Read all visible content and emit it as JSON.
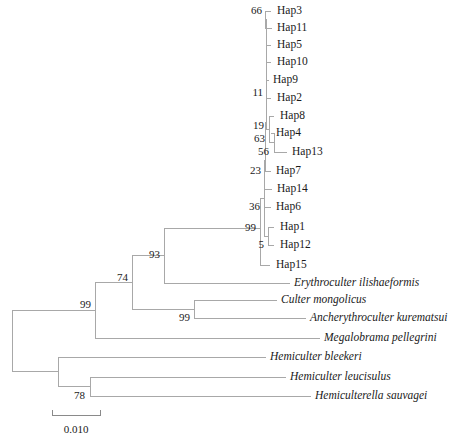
{
  "figure": {
    "kind": "phylogenetic-tree",
    "width": 451,
    "height": 444,
    "background_color": "#ffffff",
    "branch_color": "#a8a8a8",
    "text_color": "#1a1a1a"
  },
  "scale_bar": {
    "label": "0.010",
    "x_start": 52,
    "x_end": 100,
    "y": 415,
    "tick_height": 5,
    "label_x": 76,
    "label_y": 430
  },
  "chart_data": {
    "type": "tree",
    "title": "",
    "xlabel": "",
    "ylabel": "",
    "scale_bar_value": 0.01,
    "tips": [
      {
        "name": "Hap3",
        "label": "Hap3",
        "italic": false,
        "x_tip": 271,
        "y": 11,
        "label_x": 277
      },
      {
        "name": "Hap11",
        "label": "Hap11",
        "italic": false,
        "x_tip": 272,
        "y": 28,
        "label_x": 277
      },
      {
        "name": "Hap5",
        "label": "Hap5",
        "italic": false,
        "x_tip": 271,
        "y": 45,
        "label_x": 277
      },
      {
        "name": "Hap10",
        "label": "Hap10",
        "italic": false,
        "x_tip": 271,
        "y": 62,
        "label_x": 277
      },
      {
        "name": "Hap9",
        "label": "Hap9",
        "italic": false,
        "x_tip": 269,
        "y": 80,
        "label_x": 273
      },
      {
        "name": "Hap2",
        "label": "Hap2",
        "italic": false,
        "x_tip": 271,
        "y": 98,
        "label_x": 277
      },
      {
        "name": "Hap8",
        "label": "Hap8",
        "italic": false,
        "x_tip": 274,
        "y": 116,
        "label_x": 280
      },
      {
        "name": "Hap4",
        "label": "Hap4",
        "italic": false,
        "x_tip": 271,
        "y": 133,
        "label_x": 276
      },
      {
        "name": "Hap13",
        "label": "Hap13",
        "italic": false,
        "x_tip": 287,
        "y": 152,
        "label_x": 292
      },
      {
        "name": "Hap7",
        "label": "Hap7",
        "italic": false,
        "x_tip": 271,
        "y": 171,
        "label_x": 276
      },
      {
        "name": "Hap14",
        "label": "Hap14",
        "italic": false,
        "x_tip": 272,
        "y": 189,
        "label_x": 277
      },
      {
        "name": "Hap6",
        "label": "Hap6",
        "italic": false,
        "x_tip": 271,
        "y": 207,
        "label_x": 276
      },
      {
        "name": "Hap1",
        "label": "Hap1",
        "italic": false,
        "x_tip": 274,
        "y": 227,
        "label_x": 280
      },
      {
        "name": "Hap12",
        "label": "Hap12",
        "italic": false,
        "x_tip": 274,
        "y": 245,
        "label_x": 280
      },
      {
        "name": "Hap15",
        "label": "Hap15",
        "italic": false,
        "x_tip": 270,
        "y": 265,
        "label_x": 276
      },
      {
        "name": "Erythroculter ilishaeformis",
        "label": "Erythroculter ilishaeformis",
        "italic": true,
        "x_tip": 290,
        "y": 283,
        "label_x": 294
      },
      {
        "name": "Culter mongolicus",
        "label": "Culter mongolicus",
        "italic": true,
        "x_tip": 277,
        "y": 300,
        "label_x": 281
      },
      {
        "name": "Ancherythroculter kurematsui",
        "label": "Ancherythroculter kurematsui",
        "italic": true,
        "x_tip": 306,
        "y": 318,
        "label_x": 310
      },
      {
        "name": "Megalobrama pellegrini",
        "label": "Megalobrama pellegrini",
        "italic": true,
        "x_tip": 320,
        "y": 338,
        "label_x": 324
      },
      {
        "name": "Hemiculter bleekeri",
        "label": "Hemiculter bleekeri",
        "italic": true,
        "x_tip": 266,
        "y": 357,
        "label_x": 270
      },
      {
        "name": "Hemiculter leucisulus",
        "label": "Hemiculter leucisulus",
        "italic": true,
        "x_tip": 286,
        "y": 377,
        "label_x": 290
      },
      {
        "name": "Hemiculterella sauvagei",
        "label": "Hemiculterella sauvagei",
        "italic": true,
        "x_tip": 311,
        "y": 396,
        "label_x": 315
      }
    ],
    "internal_nodes": [
      {
        "name": "node-hap3-hap11",
        "support": "66",
        "x": 265,
        "y": 19,
        "children_y": [
          11,
          28
        ],
        "children_x": [
          271,
          272
        ],
        "label_x": 262,
        "label_y": 11
      },
      {
        "name": "node-hap9-hap2",
        "support": "11",
        "x": 266,
        "y": 89,
        "children_y": [
          80,
          98
        ],
        "children_x": [
          269,
          271
        ],
        "label_x": 263,
        "label_y": 93
      },
      {
        "name": "node-hap4-hap13",
        "support": "56",
        "x": 274,
        "y": 142,
        "children_y": [
          133,
          152
        ],
        "children_x": [
          271,
          287
        ],
        "label_x": 269,
        "label_y": 152
      },
      {
        "name": "node-hap8-clade",
        "support": "63",
        "x": 269,
        "y": 129,
        "children_y": [
          116,
          142
        ],
        "children_x": [
          274,
          274
        ],
        "label_x": 265,
        "label_y": 139
      },
      {
        "name": "node-upper-haps",
        "support": "19",
        "x": 266,
        "y": 122,
        "children_y": [
          19,
          45,
          62,
          89,
          129
        ],
        "children_x": [
          265,
          271,
          271,
          266,
          269
        ],
        "label_x": 264,
        "label_y": 126
      },
      {
        "name": "node-hap7-group",
        "support": "23",
        "x": 265,
        "y": 160,
        "children_y": [
          122,
          171
        ],
        "children_x": [
          266,
          271
        ],
        "label_x": 261,
        "label_y": 171
      },
      {
        "name": "node-hap1-hap12",
        "support": "5",
        "x": 268,
        "y": 236,
        "children_y": [
          227,
          245
        ],
        "children_x": [
          274,
          274
        ],
        "label_x": 264,
        "label_y": 245
      },
      {
        "name": "node-hap6-group",
        "support": "36",
        "x": 264,
        "y": 198,
        "children_y": [
          160,
          189,
          207,
          236
        ],
        "children_x": [
          265,
          272,
          271,
          268
        ],
        "label_x": 260,
        "label_y": 207
      },
      {
        "name": "node-haplotype-clade",
        "support": "99",
        "x": 260,
        "y": 228,
        "children_y": [
          198,
          265
        ],
        "children_x": [
          264,
          270
        ],
        "label_x": 256,
        "label_y": 228
      },
      {
        "name": "node-93",
        "support": "93",
        "x": 164,
        "y": 255,
        "children_y": [
          228,
          283
        ],
        "children_x": [
          260,
          290
        ],
        "label_x": 160,
        "label_y": 255
      },
      {
        "name": "node-culter-ancher",
        "support": "99",
        "x": 194,
        "y": 309,
        "children_y": [
          300,
          318
        ],
        "children_x": [
          277,
          306
        ],
        "label_x": 190,
        "label_y": 318
      },
      {
        "name": "node-74",
        "support": "74",
        "x": 132,
        "y": 282,
        "children_y": [
          255,
          309
        ],
        "children_x": [
          164,
          194
        ],
        "label_x": 128,
        "label_y": 278
      },
      {
        "name": "node-99-upper",
        "support": "99",
        "x": 95,
        "y": 310,
        "children_y": [
          282,
          338
        ],
        "children_x": [
          132,
          320
        ],
        "label_x": 91,
        "label_y": 305
      },
      {
        "name": "node-78",
        "support": "78",
        "x": 90,
        "y": 386,
        "children_y": [
          377,
          396
        ],
        "children_x": [
          286,
          311
        ],
        "label_x": 85,
        "label_y": 396
      },
      {
        "name": "node-hemiculter",
        "support": "",
        "x": 58,
        "y": 371,
        "children_y": [
          357,
          386
        ],
        "children_x": [
          266,
          90
        ],
        "label_x": 54,
        "label_y": 371
      },
      {
        "name": "node-root",
        "support": "",
        "x": 12,
        "y": 340,
        "children_y": [
          310,
          371
        ],
        "children_x": [
          95,
          58
        ],
        "label_x": 8,
        "label_y": 340
      }
    ]
  }
}
